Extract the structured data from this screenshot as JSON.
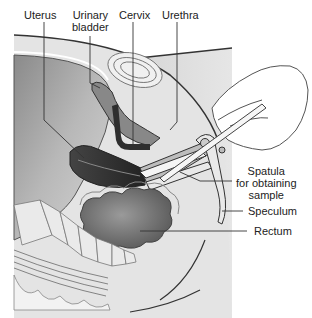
{
  "diagram": {
    "colors": {
      "background": "#ffffff",
      "body_fill": "#cfcfcf",
      "cavity_dark": "#6e6e6e",
      "outline": "#333333",
      "bone": "#e8e8e8",
      "label_text": "#222222",
      "leader_line": "#333333"
    },
    "labels": {
      "uterus": "Uterus",
      "urinary_bladder_line1": "Urinary",
      "urinary_bladder_line2": "bladder",
      "cervix": "Cervix",
      "urethra": "Urethra",
      "spatula_line1": "Spatula",
      "spatula_line2": "for obtaining",
      "spatula_line3": "sample",
      "speculum": "Speculum",
      "rectum": "Rectum"
    }
  }
}
